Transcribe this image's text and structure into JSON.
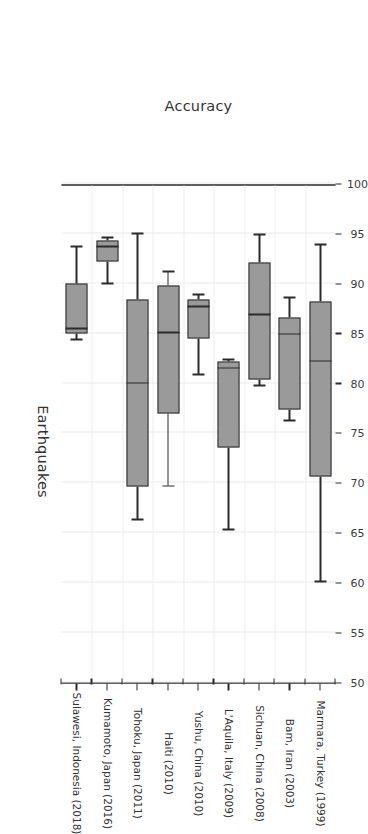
{
  "chart_data": {
    "type": "box",
    "title": "",
    "xlabel": "Earthquakes",
    "ylabel": "Accuracy",
    "orientation": "rotated-90",
    "grid": true,
    "legend": "none",
    "value_axis": {
      "label": "Accuracy",
      "min": 50,
      "max": 100,
      "tick_step": 5,
      "ticks": [
        50,
        55,
        60,
        65,
        70,
        75,
        80,
        85,
        90,
        95,
        100
      ],
      "tick_labels": [
        "50",
        "55",
        "60",
        "65",
        "70",
        "75",
        "80",
        "85",
        "90",
        "95",
        "100"
      ]
    },
    "category_axis": {
      "label": "Earthquakes",
      "categories": [
        "Sulawesi, Indonesia (2018)",
        "Kumamoto, Japan (2016)",
        "Tohoku, Japan (2011)",
        "Haiti (2010)",
        "Yushu, China (2010)",
        "L'Aquila, Italy (2009)",
        "Sichuan, China (2008)",
        "Bam, Iran (2003)",
        "Marmara, Turkey (1999)"
      ]
    },
    "boxes": [
      {
        "category": "Sulawesi, Indonesia (2018)",
        "whisker_low": 84.4,
        "q1": 85.0,
        "median": 85.5,
        "q3": 90.0,
        "whisker_high": 93.7
      },
      {
        "category": "Kumamoto, Japan (2016)",
        "whisker_low": 90.0,
        "q1": 92.2,
        "median": 93.7,
        "q3": 94.3,
        "whisker_high": 94.6
      },
      {
        "category": "Tohoku, Japan (2011)",
        "whisker_low": 66.3,
        "q1": 69.6,
        "median": 80.0,
        "q3": 88.4,
        "whisker_high": 95.0
      },
      {
        "category": "Haiti (2010)",
        "whisker_low": 69.7,
        "q1": 77.0,
        "median": 85.1,
        "q3": 89.8,
        "whisker_high": 91.2
      },
      {
        "category": "Yushu, China (2010)",
        "whisker_low": 80.9,
        "q1": 84.5,
        "median": 87.7,
        "q3": 88.4,
        "whisker_high": 88.9
      },
      {
        "category": "L'Aquila, Italy (2009)",
        "whisker_low": 65.3,
        "q1": 73.5,
        "median": 81.5,
        "q3": 82.2,
        "whisker_high": 82.4
      },
      {
        "category": "Sichuan, China (2008)",
        "whisker_low": 79.8,
        "q1": 80.4,
        "median": 86.9,
        "q3": 92.1,
        "whisker_high": 94.9
      },
      {
        "category": "Bam, Iran (2003)",
        "whisker_low": 76.3,
        "q1": 77.4,
        "median": 84.9,
        "q3": 86.6,
        "whisker_high": 88.6
      },
      {
        "category": "Marmara, Turkey (1999)",
        "whisker_low": 60.1,
        "q1": 70.6,
        "median": 82.2,
        "q3": 88.2,
        "whisker_high": 93.9
      }
    ],
    "colors": {
      "box_fill": "#9a9a9a",
      "box_edge": "#2b2b2b",
      "grid": "#e9e9e9",
      "text": "#333333",
      "background": "#ffffff"
    }
  }
}
